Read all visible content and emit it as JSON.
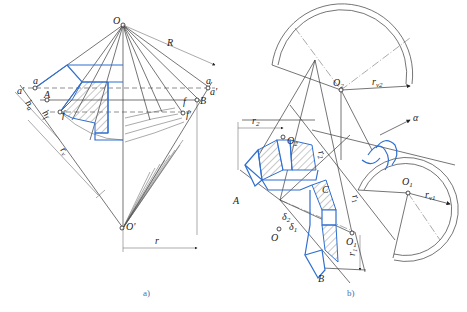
{
  "figure": {
    "panel_a": {
      "caption": "a)",
      "labels": {
        "O": "O",
        "O_prime": "O'",
        "R": "R",
        "r": "r",
        "r_v": "r",
        "r_v_sub": "v",
        "a_left": "a",
        "a_prime_left": "a'",
        "a_right": "a",
        "a_prime_right": "a'",
        "A": "A",
        "B": "B",
        "f_left": "f",
        "f_prime_left": "f'",
        "f_right": "f",
        "f_prime_right": "f'",
        "h_a": "h",
        "h_a_sub": "a",
        "h_f": "h",
        "h_f_sub": "f"
      }
    },
    "panel_b": {
      "caption": "b)",
      "labels": {
        "O": "O",
        "O1": "O",
        "O1_sub": "1",
        "O2": "O",
        "O2_sub": "2",
        "O1_prime": "O",
        "O1_prime_sub": "1",
        "O2_prime": "O",
        "O2_prime_sub": "2",
        "A": "A",
        "B": "B",
        "C": "C",
        "r1": "r",
        "r1_sub": "1",
        "r2": "r",
        "r2_sub": "2",
        "rv1": "r",
        "rv1_sub": "v1",
        "rv2": "r",
        "rv2_sub": "v2",
        "delta1": "δ",
        "delta1_sub": "1",
        "delta2": "δ",
        "delta2_sub": "2",
        "alpha": "α"
      }
    },
    "colors": {
      "line": "#3a3a3a",
      "gear_outline": "#2f6fd0",
      "caption": "#4a6fb0"
    }
  }
}
